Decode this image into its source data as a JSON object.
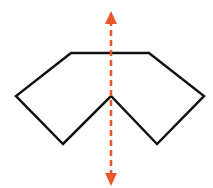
{
  "diagram": {
    "shape": {
      "points": "71,53 149,53 204,96 157,144 111,96 63,144 16,96",
      "stroke": "#111111",
      "stroke_width": 2.5
    },
    "symmetry_line": {
      "x": 111,
      "y1": 20,
      "y2": 178,
      "color": "#e8572a",
      "dash": "6,4"
    }
  }
}
